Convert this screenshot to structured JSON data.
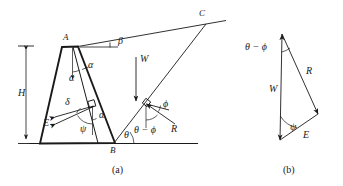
{
  "figure": {
    "panels": [
      {
        "key": "a",
        "caption": "(a)",
        "description": "Retaining wall with sloping backfill, failure wedge and force vectors"
      },
      {
        "key": "b",
        "caption": "(b)",
        "description": "Force triangle of W, R and E"
      }
    ],
    "line_color": "#1a1a1a",
    "background_color": "#ffffff"
  },
  "panel_a": {
    "points": {
      "A": "A",
      "B": "B",
      "C": "C"
    },
    "dimensions": {
      "height_label": "H"
    },
    "angles": {
      "beta": "β",
      "alpha_top": "α",
      "alpha_inner": "α",
      "alpha_mid": "α",
      "delta": "δ",
      "psi": "ψ",
      "theta": "θ",
      "phi": "ϕ",
      "theta_minus_phi": "θ − ϕ"
    },
    "forces": {
      "W": "W",
      "E": "E",
      "R": "R"
    }
  },
  "panel_b": {
    "forces": {
      "W": "W",
      "R": "R",
      "E": "E"
    },
    "angles": {
      "theta_minus_phi": "θ − ϕ",
      "psi": "ψ"
    }
  }
}
